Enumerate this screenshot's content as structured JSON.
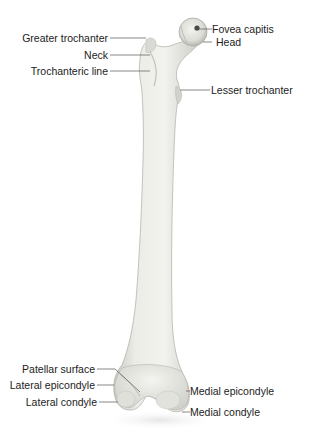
{
  "diagram": {
    "view": "anterior",
    "colors": {
      "background": "#ffffff",
      "bone_fill": "#ebebe6",
      "bone_shade": "#c8c8c2",
      "leader_line": "#555555",
      "label_text": "#222222"
    },
    "labels": {
      "greater_trochanter": "Greater trochanter",
      "neck": "Neck",
      "trochanteric_line": "Trochanteric line",
      "fovea_capitis": "Fovea capitis",
      "head": "Head",
      "lesser_trochanter": "Lesser trochanter",
      "patellar_surface": "Patellar surface",
      "lateral_epicondyle": "Lateral epicondyle",
      "lateral_condyle": "Lateral condyle",
      "medial_epicondyle": "Medial epicondyle",
      "medial_condyle": "Medial condyle"
    }
  }
}
